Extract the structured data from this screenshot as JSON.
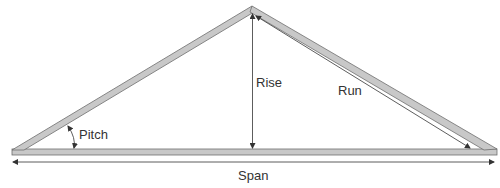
{
  "diagram": {
    "type": "roof-truss",
    "labels": {
      "pitch": "Pitch",
      "rise": "Rise",
      "run": "Run",
      "span": "Span"
    },
    "colors": {
      "member_fill": "#c8c8c8",
      "member_stroke": "#6e6e6e",
      "line": "#333333",
      "background": "#ffffff"
    }
  }
}
